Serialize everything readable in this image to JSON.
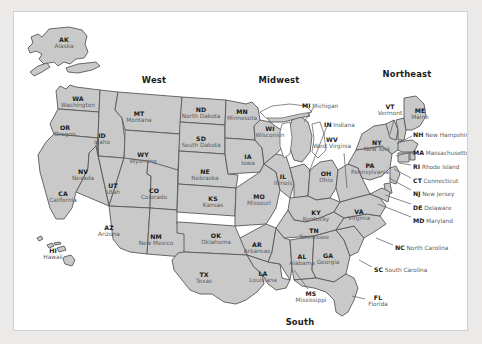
{
  "map": {
    "title": "United States Regions Map",
    "colors": {
      "page_background": "#eceae8",
      "canvas_background": "#ffffff",
      "state_fill": "#c9c9c9",
      "state_border": "#58585a",
      "abbrev_text": "#1a1a1a",
      "name_text": "#5c5c5c",
      "frame_border": "#d2d0ce"
    },
    "regions": [
      {
        "id": "west",
        "label": "West",
        "x": 140,
        "y": 68
      },
      {
        "id": "midwest",
        "label": "Midwest",
        "x": 265,
        "y": 68
      },
      {
        "id": "northeast",
        "label": "Northeast",
        "x": 393,
        "y": 62
      },
      {
        "id": "south",
        "label": "South",
        "x": 286,
        "y": 310
      }
    ],
    "states": [
      {
        "abbr": "AK",
        "name": "Alaska",
        "x": 50,
        "y": 31,
        "placement": "inside"
      },
      {
        "abbr": "HI",
        "name": "Hawaii",
        "x": 39,
        "y": 242,
        "placement": "inside"
      },
      {
        "abbr": "WA",
        "name": "Washington",
        "x": 64,
        "y": 90,
        "placement": "inside"
      },
      {
        "abbr": "OR",
        "name": "Oregon",
        "x": 51,
        "y": 119,
        "placement": "inside"
      },
      {
        "abbr": "CA",
        "name": "California",
        "x": 49,
        "y": 185,
        "placement": "inside"
      },
      {
        "abbr": "ID",
        "name": "Idaho",
        "x": 88,
        "y": 127,
        "placement": "inside"
      },
      {
        "abbr": "NV",
        "name": "Nevada",
        "x": 69,
        "y": 163,
        "placement": "inside"
      },
      {
        "abbr": "MT",
        "name": "Montana",
        "x": 125,
        "y": 105,
        "placement": "inside"
      },
      {
        "abbr": "WY",
        "name": "Wyoming",
        "x": 129,
        "y": 146,
        "placement": "inside"
      },
      {
        "abbr": "UT",
        "name": "Utah",
        "x": 99,
        "y": 177,
        "placement": "inside"
      },
      {
        "abbr": "CO",
        "name": "Colorado",
        "x": 140,
        "y": 182,
        "placement": "inside"
      },
      {
        "abbr": "AZ",
        "name": "Arizona",
        "x": 95,
        "y": 219,
        "placement": "inside"
      },
      {
        "abbr": "NM",
        "name": "New Mexico",
        "x": 142,
        "y": 228,
        "placement": "inside"
      },
      {
        "abbr": "ND",
        "name": "North Dakota",
        "x": 187,
        "y": 101,
        "placement": "inside"
      },
      {
        "abbr": "SD",
        "name": "South Dakota",
        "x": 187,
        "y": 130,
        "placement": "inside"
      },
      {
        "abbr": "NE",
        "name": "Nebraska",
        "x": 191,
        "y": 163,
        "placement": "inside"
      },
      {
        "abbr": "KS",
        "name": "Kansas",
        "x": 199,
        "y": 190,
        "placement": "inside"
      },
      {
        "abbr": "OK",
        "name": "Oklahoma",
        "x": 202,
        "y": 227,
        "placement": "inside"
      },
      {
        "abbr": "TX",
        "name": "Texas",
        "x": 190,
        "y": 266,
        "placement": "inside"
      },
      {
        "abbr": "MN",
        "name": "Minnesota",
        "x": 228,
        "y": 103,
        "placement": "inside"
      },
      {
        "abbr": "IA",
        "name": "Iowa",
        "x": 234,
        "y": 148,
        "placement": "inside"
      },
      {
        "abbr": "MO",
        "name": "Missouri",
        "x": 245,
        "y": 188,
        "placement": "inside"
      },
      {
        "abbr": "AR",
        "name": "Arkansas",
        "x": 243,
        "y": 236,
        "placement": "inside"
      },
      {
        "abbr": "LA",
        "name": "Louisiana",
        "x": 249,
        "y": 265,
        "placement": "inside"
      },
      {
        "abbr": "WI",
        "name": "Wisconsin",
        "x": 256,
        "y": 120,
        "placement": "inside"
      },
      {
        "abbr": "IL",
        "name": "Illinois",
        "x": 269,
        "y": 168,
        "placement": "inside"
      },
      {
        "abbr": "KY",
        "name": "Kentucky",
        "x": 302,
        "y": 204,
        "placement": "inside"
      },
      {
        "abbr": "TN",
        "name": "Tennessee",
        "x": 300,
        "y": 222,
        "placement": "inside"
      },
      {
        "abbr": "AL",
        "name": "Alabama",
        "x": 288,
        "y": 248,
        "placement": "inside"
      },
      {
        "abbr": "GA",
        "name": "Georgia",
        "x": 314,
        "y": 247,
        "placement": "inside"
      },
      {
        "abbr": "OH",
        "name": "Ohio",
        "x": 312,
        "y": 165,
        "placement": "inside"
      },
      {
        "abbr": "VA",
        "name": "Virginia",
        "x": 345,
        "y": 203,
        "placement": "inside"
      },
      {
        "abbr": "NY",
        "name": "New York",
        "x": 363,
        "y": 134,
        "placement": "inside"
      },
      {
        "abbr": "PA",
        "name": "Pennsylvania",
        "x": 356,
        "y": 157,
        "placement": "inside"
      },
      {
        "abbr": "MI",
        "name": "Michigan",
        "x": 288,
        "y": 91,
        "placement": "callout-right",
        "leader": [
          [
            300,
            95
          ],
          [
            290,
            110
          ]
        ]
      },
      {
        "abbr": "IN",
        "name": "Indiana",
        "x": 310,
        "y": 110,
        "placement": "callout-right",
        "leader": [
          [
            313,
            114
          ],
          [
            295,
            160
          ]
        ]
      },
      {
        "abbr": "WV",
        "name": "West Virginia",
        "x": 318,
        "y": 131,
        "placement": "callout-stack",
        "leader": [
          [
            330,
            141
          ],
          [
            333,
            176
          ]
        ]
      },
      {
        "abbr": "VT",
        "name": "Vermont",
        "x": 376,
        "y": 98,
        "placement": "callout-stack",
        "leader": [
          [
            380,
            108
          ],
          [
            376,
            122
          ]
        ]
      },
      {
        "abbr": "ME",
        "name": "Maine",
        "x": 406,
        "y": 102,
        "placement": "inside"
      },
      {
        "abbr": "NH",
        "name": "New Hampshire",
        "x": 399,
        "y": 120,
        "placement": "callout-right",
        "leader": [
          [
            398,
            124
          ],
          [
            383,
            132
          ]
        ]
      },
      {
        "abbr": "MA",
        "name": "Massachusetts",
        "x": 399,
        "y": 138,
        "placement": "callout-right",
        "leader": [
          [
            398,
            140
          ],
          [
            382,
            144
          ]
        ]
      },
      {
        "abbr": "RI",
        "name": "Rhode Island",
        "x": 399,
        "y": 152,
        "placement": "callout-right",
        "leader": [
          [
            397,
            153
          ],
          [
            385,
            151
          ]
        ]
      },
      {
        "abbr": "CT",
        "name": "Connecticut",
        "x": 399,
        "y": 166,
        "placement": "callout-right",
        "leader": [
          [
            397,
            166
          ],
          [
            380,
            157
          ]
        ]
      },
      {
        "abbr": "NJ",
        "name": "New Jersey",
        "x": 399,
        "y": 179,
        "placement": "callout-right",
        "leader": [
          [
            397,
            178
          ],
          [
            375,
            166
          ]
        ]
      },
      {
        "abbr": "DE",
        "name": "Delaware",
        "x": 399,
        "y": 193,
        "placement": "callout-right",
        "leader": [
          [
            397,
            192
          ],
          [
            371,
            183
          ]
        ]
      },
      {
        "abbr": "MD",
        "name": "Maryland",
        "x": 399,
        "y": 206,
        "placement": "callout-right",
        "leader": [
          [
            397,
            205
          ],
          [
            364,
            192
          ]
        ]
      },
      {
        "abbr": "NC",
        "name": "North Carolina",
        "x": 381,
        "y": 233,
        "placement": "callout-right",
        "leader": [
          [
            379,
            233
          ],
          [
            362,
            226
          ]
        ]
      },
      {
        "abbr": "SC",
        "name": "South Carolina",
        "x": 360,
        "y": 255,
        "placement": "callout-right",
        "leader": [
          [
            358,
            255
          ],
          [
            345,
            248
          ]
        ]
      },
      {
        "abbr": "FL",
        "name": "Florida",
        "x": 364,
        "y": 289,
        "placement": "callout-stack",
        "leader": [
          [
            351,
            287
          ],
          [
            338,
            284
          ]
        ]
      },
      {
        "abbr": "MS",
        "name": "Mississippi",
        "x": 297,
        "y": 285,
        "placement": "callout-stack",
        "leader": [
          [
            294,
            277
          ],
          [
            280,
            258
          ]
        ]
      }
    ]
  }
}
